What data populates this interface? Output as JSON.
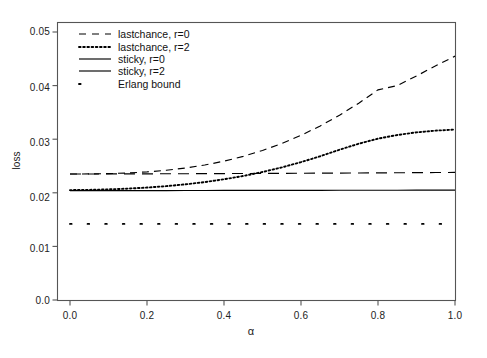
{
  "chart_data": {
    "type": "line",
    "title": "",
    "xlabel": "α",
    "ylabel": "loss",
    "xlim": [
      0.0,
      1.0
    ],
    "ylim": [
      0.0,
      0.05
    ],
    "xticks": [
      "0.0",
      "0.2",
      "0.4",
      "0.6",
      "0.8",
      "1.0"
    ],
    "xtick_values": [
      0.0,
      0.2,
      0.4,
      0.6,
      0.8,
      1.0
    ],
    "yticks": [
      "0.0",
      "0.01",
      "0.02",
      "0.03",
      "0.04",
      "0.05"
    ],
    "ytick_values": [
      0.0,
      0.01,
      0.02,
      0.03,
      0.04,
      0.05
    ],
    "grid": false,
    "legend_position": "top-left",
    "x": [
      0.0,
      0.05,
      0.1,
      0.15,
      0.2,
      0.25,
      0.3,
      0.35,
      0.4,
      0.45,
      0.5,
      0.55,
      0.6,
      0.65,
      0.7,
      0.75,
      0.8,
      0.85,
      0.9,
      0.95,
      1.0
    ],
    "series": [
      {
        "name": "lastchance, r=0",
        "style": "dashed",
        "color": "#000000",
        "values": [
          0.0235,
          0.02352,
          0.02358,
          0.0237,
          0.0239,
          0.0242,
          0.02462,
          0.02518,
          0.0259,
          0.0268,
          0.0279,
          0.0292,
          0.03072,
          0.03248,
          0.03448,
          0.03672,
          0.0392,
          0.04,
          0.0418,
          0.0437,
          0.0455
        ]
      },
      {
        "name": "lastchance, r=2",
        "style": "dotted",
        "color": "#000000",
        "values": [
          0.0205,
          0.02055,
          0.02064,
          0.02078,
          0.02098,
          0.02124,
          0.02158,
          0.022,
          0.02252,
          0.02314,
          0.02388,
          0.02474,
          0.02572,
          0.02682,
          0.02804,
          0.02916,
          0.0301,
          0.03078,
          0.03128,
          0.0316,
          0.0318
        ]
      },
      {
        "name": "sticky, r=0",
        "style": "longdash",
        "color": "#000000",
        "values": [
          0.0235,
          0.02351,
          0.02352,
          0.02353,
          0.02354,
          0.02355,
          0.02356,
          0.02357,
          0.02359,
          0.0236,
          0.02362,
          0.02363,
          0.02365,
          0.02366,
          0.02368,
          0.0237,
          0.02372,
          0.02374,
          0.02376,
          0.02378,
          0.0238
        ]
      },
      {
        "name": "sticky, r=2",
        "style": "solid",
        "color": "#000000",
        "values": [
          0.0204,
          0.0204,
          0.02041,
          0.02041,
          0.02042,
          0.02042,
          0.02043,
          0.02043,
          0.02044,
          0.02044,
          0.02045,
          0.02045,
          0.02046,
          0.02046,
          0.02047,
          0.02047,
          0.02048,
          0.02048,
          0.02049,
          0.02049,
          0.0205
        ]
      },
      {
        "name": "Erlang bound",
        "style": "sparse-dotted",
        "color": "#000000",
        "values": [
          0.0142,
          0.0142,
          0.0142,
          0.0142,
          0.0142,
          0.0142,
          0.0142,
          0.0142,
          0.0142,
          0.0142,
          0.0142,
          0.0142,
          0.0142,
          0.0142,
          0.0142,
          0.0142,
          0.0142,
          0.0142,
          0.0142,
          0.0142,
          0.0142
        ]
      }
    ]
  },
  "legend": {
    "entries": [
      {
        "label": "lastchance, r=0"
      },
      {
        "label": "lastchance, r=2"
      },
      {
        "label": "sticky, r=0"
      },
      {
        "label": "sticky, r=2"
      },
      {
        "label": "Erlang bound"
      }
    ]
  },
  "axes": {
    "y_label": "loss",
    "x_label": "α",
    "y_tick_0": "0.0",
    "y_tick_1": "0.01",
    "y_tick_2": "0.02",
    "y_tick_3": "0.03",
    "y_tick_4": "0.04",
    "y_tick_5": "0.05",
    "x_tick_0": "0.0",
    "x_tick_1": "0.2",
    "x_tick_2": "0.4",
    "x_tick_3": "0.6",
    "x_tick_4": "0.8",
    "x_tick_5": "1.0"
  },
  "colors": {
    "axis": "#555555",
    "line": "#000000",
    "background": "#ffffff"
  }
}
